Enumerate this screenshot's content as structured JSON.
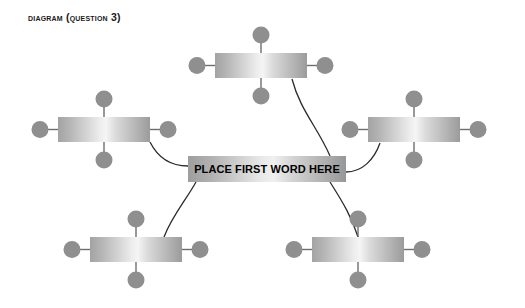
{
  "page": {
    "title": "Diagram (Question 3)",
    "background_color": "#ffffff",
    "width": 525,
    "height": 308
  },
  "colors": {
    "knob": "#8f8f8f",
    "stem": "#6e6e6e",
    "connector": "#2b2b2b",
    "bar_gradient_dark": "#a0a0a0",
    "bar_gradient_light": "#f2f2f2",
    "label_text": "#000000",
    "title_text": "#1a1a1a"
  },
  "center_node": {
    "label": "PLACE FIRST WORD HERE",
    "x": 188,
    "y": 156,
    "width": 158,
    "height": 26
  },
  "satellite_nodes": [
    {
      "name": "top",
      "label": "",
      "x": 215,
      "y": 53,
      "width": 92,
      "height": 25,
      "knobs": [
        "top",
        "bottom",
        "left",
        "right"
      ]
    },
    {
      "name": "left",
      "label": "",
      "x": 58,
      "y": 117,
      "width": 92,
      "height": 25,
      "knobs": [
        "top",
        "bottom",
        "left",
        "right"
      ]
    },
    {
      "name": "right",
      "label": "",
      "x": 368,
      "y": 117,
      "width": 92,
      "height": 25,
      "knobs": [
        "top",
        "bottom",
        "left",
        "right"
      ]
    },
    {
      "name": "bottom-left",
      "label": "",
      "x": 90,
      "y": 237,
      "width": 92,
      "height": 25,
      "knobs": [
        "top",
        "bottom",
        "left",
        "right"
      ]
    },
    {
      "name": "bottom-right",
      "label": "",
      "x": 312,
      "y": 237,
      "width": 92,
      "height": 25,
      "knobs": [
        "top",
        "bottom",
        "left",
        "right"
      ]
    }
  ],
  "connectors": [
    {
      "name": "center-to-top",
      "path": "M 330 156 C 318 128 300 110 292 79"
    },
    {
      "name": "center-to-left",
      "path": "M 188 166 C 175 166 160 162 150 142"
    },
    {
      "name": "center-to-right",
      "path": "M 346 172 C 362 172 374 160 380 143"
    },
    {
      "name": "center-to-bottom-left",
      "path": "M 196 182 C 186 200 172 216 164 237"
    },
    {
      "name": "center-to-bottom-right",
      "path": "M 330 182 C 344 204 352 218 358 237"
    }
  ],
  "geometry": {
    "knob_radius": 8.5,
    "knob_stem_length": 18
  }
}
